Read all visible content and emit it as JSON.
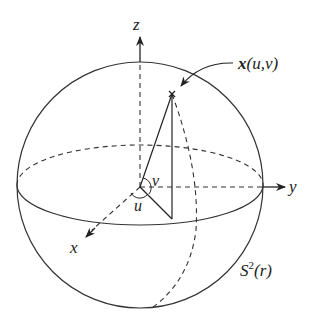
{
  "diagram": {
    "type": "sphere-parametrization",
    "labels": {
      "z_axis": "z",
      "y_axis": "y",
      "x_axis": "x",
      "point": "x(u,v)",
      "point_bold": "x",
      "point_args": "(u,v)",
      "angle_u": "u",
      "angle_v": "v",
      "surface": "S",
      "surface_sup": "2",
      "surface_arg": "(r)"
    },
    "colors": {
      "stroke": "#222222",
      "background": "#ffffff"
    }
  }
}
